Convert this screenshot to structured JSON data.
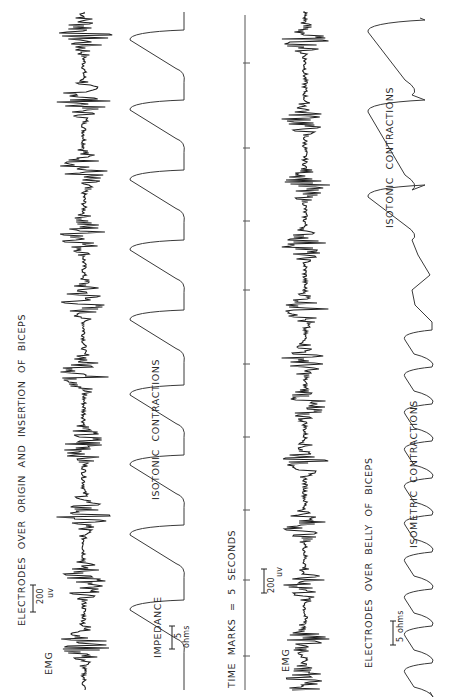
{
  "figure": {
    "colors": {
      "ink": "#1e1e1e",
      "trace": "#3a3a3a",
      "axis": "#555555",
      "background": "#ffffff"
    },
    "orientation": "rotated 90 degrees counter-clockwise (time runs bottom-to-top)",
    "upper_panel": {
      "title": "ELECTRODES OVER ORIGIN AND INSERTION OF BICEPS",
      "emg_label": "EMG",
      "emg_scale": {
        "value": "200",
        "unit": "uv"
      },
      "impedance_label": "IMPEDANCE",
      "impedance_scale": {
        "value": "5",
        "unit": "ohms"
      },
      "contraction_label": "ISOTONIC CONTRACTIONS"
    },
    "time_axis": {
      "label": "TIME MARKS = 5 SECONDS",
      "tick_positions_px": [
        63,
        148,
        221,
        290,
        364,
        437,
        510,
        580,
        656
      ]
    },
    "lower_panel": {
      "title": "ELECTRODES OVER BELLY OF BICEPS",
      "emg_label": "EMG",
      "emg_scale": {
        "value": "200",
        "unit": "uv"
      },
      "impedance_scale": {
        "value": "5",
        "unit": "ohms"
      },
      "contraction_label_isometric": "ISOMETRIC CONTRACTIONS",
      "contraction_label_isotonic": "ISOTONIC CONTRACTIONS"
    }
  },
  "chart_data": [
    {
      "type": "line",
      "title": "Upper EMG — electrodes over origin and insertion of biceps",
      "orientation": "vertical trace, baseline x≈84px",
      "burst_centers_px": [
        35,
        100,
        170,
        235,
        300,
        375,
        445,
        515,
        580,
        645
      ],
      "scale": "200 uV"
    },
    {
      "type": "line",
      "title": "Upper impedance — isotonic contractions",
      "orientation": "vertical trace, baseline x≈180px",
      "cycle_starts_px": [
        30,
        100,
        170,
        240,
        310,
        385,
        455,
        525,
        600
      ],
      "scale": "5 ohms"
    },
    {
      "type": "line",
      "title": "Lower EMG — electrodes over belly of biceps",
      "orientation": "vertical trace, baseline x≈305px",
      "burst_centers_px": [
        40,
        120,
        185,
        245,
        310,
        360,
        405,
        460,
        525,
        585,
        640,
        680
      ],
      "scale": "200 uV"
    },
    {
      "type": "line",
      "title": "Lower impedance — isometric then isotonic contractions",
      "orientation": "vertical trace, baseline x≈420px",
      "segments": [
        {
          "label": "ISOTONIC CONTRACTIONS",
          "range_px": [
            20,
            300
          ],
          "amplitude": "large"
        },
        {
          "label": "ISOMETRIC CONTRACTIONS",
          "range_px": [
            300,
            690
          ],
          "amplitude": "small"
        }
      ],
      "scale": "5 ohms"
    }
  ]
}
